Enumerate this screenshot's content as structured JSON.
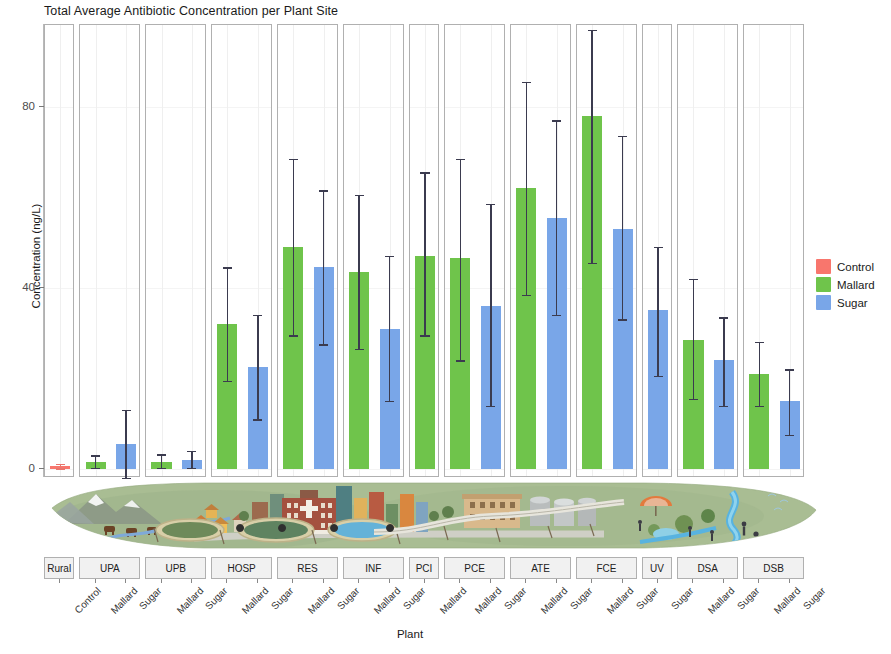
{
  "chart_data": {
    "type": "bar",
    "title": "Total Average Antibiotic Concentration per Plant Site",
    "xlabel": "Plant",
    "ylabel": "Concentration (ng/L)",
    "ylim": [
      -2,
      98
    ],
    "yticks": [
      0,
      40,
      80
    ],
    "ytick_labels": [
      "0",
      "40",
      "80"
    ],
    "grid": true,
    "legend_position": "right",
    "legend": [
      {
        "name": "Control",
        "color": "#f8766d"
      },
      {
        "name": "Mallard",
        "color": "#6fc44b"
      },
      {
        "name": "Sugar",
        "color": "#79a6e8"
      }
    ],
    "facets": [
      "Rural",
      "UPA",
      "UPB",
      "HOSP",
      "RES",
      "INF",
      "PCI",
      "PCE",
      "ATE",
      "FCE",
      "UV",
      "DSA",
      "DSB"
    ],
    "bars": [
      {
        "facet": "Rural",
        "group": "Control",
        "value": 0.6,
        "err_low": 0.1,
        "err_high": 1.2
      },
      {
        "facet": "UPA",
        "group": "Mallard",
        "value": 1.6,
        "err_low": 0.3,
        "err_high": 3.0
      },
      {
        "facet": "UPA",
        "group": "Sugar",
        "value": 5.4,
        "err_low": -2.0,
        "err_high": 13.0
      },
      {
        "facet": "UPB",
        "group": "Mallard",
        "value": 1.6,
        "err_low": 0.2,
        "err_high": 3.2
      },
      {
        "facet": "UPB",
        "group": "Sugar",
        "value": 2.0,
        "err_low": 0.2,
        "err_high": 4.0
      },
      {
        "facet": "HOSP",
        "group": "Mallard",
        "value": 32.0,
        "err_low": 19.5,
        "err_high": 44.5
      },
      {
        "facet": "HOSP",
        "group": "Sugar",
        "value": 22.5,
        "err_low": 11.0,
        "err_high": 34.0
      },
      {
        "facet": "RES",
        "group": "Mallard",
        "value": 49.0,
        "err_low": 29.5,
        "err_high": 68.5
      },
      {
        "facet": "RES",
        "group": "Sugar",
        "value": 44.5,
        "err_low": 27.5,
        "err_high": 61.5
      },
      {
        "facet": "INF",
        "group": "Mallard",
        "value": 43.5,
        "err_low": 26.5,
        "err_high": 60.5
      },
      {
        "facet": "INF",
        "group": "Sugar",
        "value": 31.0,
        "err_low": 15.0,
        "err_high": 47.0
      },
      {
        "facet": "PCI",
        "group": "Mallard",
        "value": 47.0,
        "err_low": 29.5,
        "err_high": 65.5
      },
      {
        "facet": "PCE",
        "group": "Mallard",
        "value": 46.5,
        "err_low": 24.0,
        "err_high": 68.5
      },
      {
        "facet": "PCE",
        "group": "Sugar",
        "value": 36.0,
        "err_low": 14.0,
        "err_high": 58.5
      },
      {
        "facet": "ATE",
        "group": "Mallard",
        "value": 62.0,
        "err_low": 38.5,
        "err_high": 85.5
      },
      {
        "facet": "ATE",
        "group": "Sugar",
        "value": 55.5,
        "err_low": 34.0,
        "err_high": 77.0
      },
      {
        "facet": "FCE",
        "group": "Mallard",
        "value": 78.0,
        "err_low": 45.5,
        "err_high": 97.0
      },
      {
        "facet": "FCE",
        "group": "Sugar",
        "value": 53.0,
        "err_low": 33.0,
        "err_high": 73.5
      },
      {
        "facet": "UV",
        "group": "Sugar",
        "value": 35.0,
        "err_low": 20.5,
        "err_high": 49.0
      },
      {
        "facet": "DSA",
        "group": "Mallard",
        "value": 28.5,
        "err_low": 15.5,
        "err_high": 42.0
      },
      {
        "facet": "DSA",
        "group": "Sugar",
        "value": 24.0,
        "err_low": 14.0,
        "err_high": 33.5
      },
      {
        "facet": "DSB",
        "group": "Mallard",
        "value": 21.0,
        "err_low": 14.0,
        "err_high": 28.0
      },
      {
        "facet": "DSB",
        "group": "Sugar",
        "value": 15.0,
        "err_low": 7.5,
        "err_high": 22.0
      }
    ]
  },
  "illustration": {
    "name": "watershed-landscape-illustration",
    "description": "Stylized watershed landscape running along the zero baseline: mountains and grazing cattle at left, a town with hospital and buildings, a wastewater treatment plant with tanks and clarifier basins, a UV channel, then a river with a park and people downstream."
  }
}
